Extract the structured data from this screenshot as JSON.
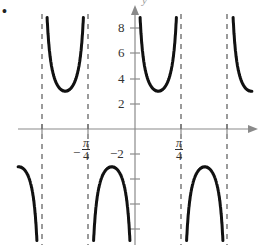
{
  "chart_data": {
    "type": "line",
    "title": "",
    "function_description": "y = 3 csc(4x)",
    "xlabel": "x",
    "ylabel": "y",
    "x_tick_labels": [
      "-π/4",
      "π/4"
    ],
    "y_tick_labels": [
      "8",
      "6",
      "4",
      "2",
      "-2"
    ],
    "y_ticks": [
      8,
      6,
      4,
      2,
      -2,
      -4,
      -6,
      -8
    ],
    "xlim": [
      -1.45,
      1.35
    ],
    "ylim": [
      -9,
      10
    ],
    "asymptotes": [
      "-π/2",
      "-π/4",
      "0",
      "π/4",
      "π/2"
    ],
    "local_extrema": [
      {
        "x": "-3π/8",
        "y": 3
      },
      {
        "x": "-π/8",
        "y": -3
      },
      {
        "x": "π/8",
        "y": 3
      },
      {
        "x": "3π/8",
        "y": -3
      }
    ],
    "grid": false,
    "curve_color": "#111111",
    "asymptote_style": "dashed",
    "axis_color": "#888888"
  },
  "labels": {
    "marker": "•",
    "y_axis_letter": "y",
    "y8": "8",
    "y6": "6",
    "y4": "4",
    "y2": "2",
    "yneg2": "−2",
    "x_neg_pi4_sign": "−",
    "pi": "π",
    "four": "4"
  }
}
